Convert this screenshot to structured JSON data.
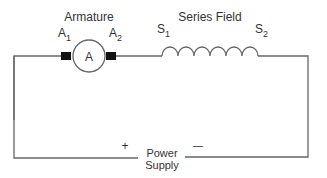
{
  "diagram": {
    "type": "series-wound DC motor circuit",
    "armature": {
      "title": "Armature",
      "symbol": "A",
      "terminal_left": {
        "main": "A",
        "sub": "1"
      },
      "terminal_right": {
        "main": "A",
        "sub": "2"
      }
    },
    "series_field": {
      "title": "Series Field",
      "terminal_left": {
        "main": "S",
        "sub": "1"
      },
      "terminal_right": {
        "main": "S",
        "sub": "2"
      }
    },
    "power_supply": {
      "line1": "Power",
      "line2": "Supply",
      "plus": "+",
      "minus": "—"
    },
    "colors": {
      "wire": "#666666",
      "terminal": "#111111",
      "text": "#333333"
    }
  }
}
